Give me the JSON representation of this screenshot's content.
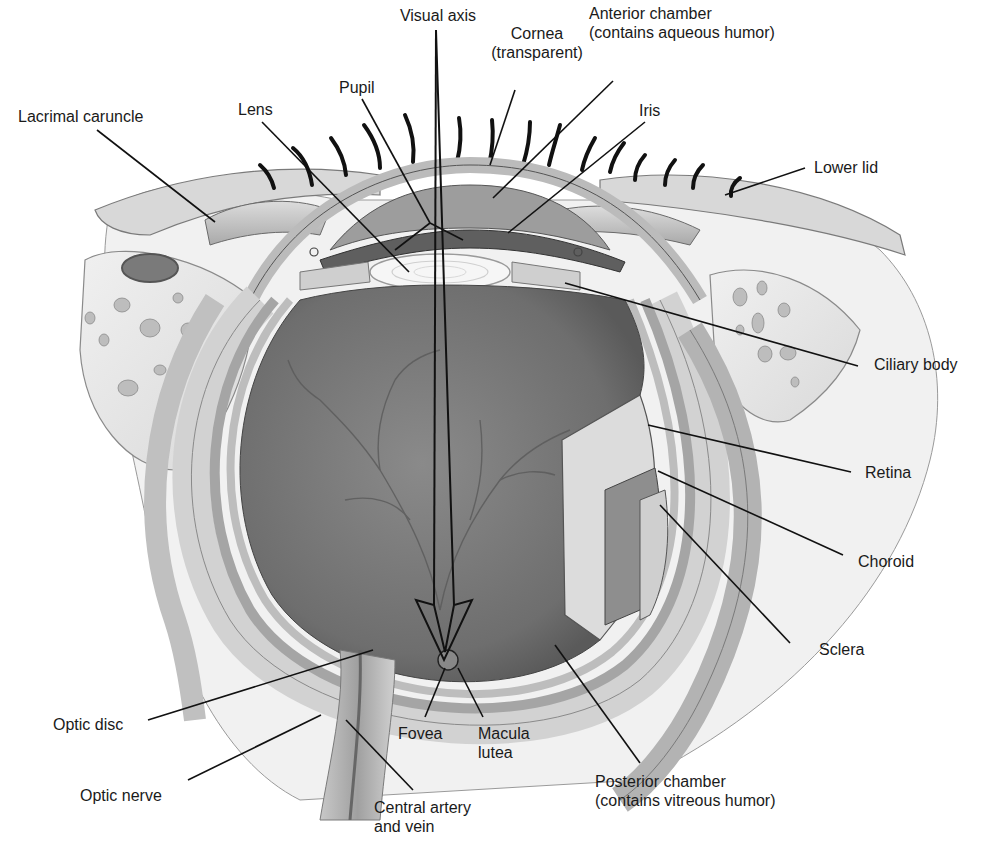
{
  "diagram": {
    "colors": {
      "background": "#ffffff",
      "line": "#111111",
      "tissue_light": "#e6e6e6",
      "tissue_mid": "#b5b5b5",
      "tissue_dark": "#6f6f6f",
      "vitreous": "#7c7c7c",
      "lens": "#f4f4f4"
    },
    "labels": {
      "visual_axis": {
        "lines": [
          "Visual axis"
        ]
      },
      "cornea": {
        "lines": [
          "Cornea",
          "(transparent)"
        ]
      },
      "anterior_chamber": {
        "lines": [
          "Anterior chamber",
          "(contains aqueous humor)"
        ]
      },
      "pupil": {
        "lines": [
          "Pupil"
        ]
      },
      "lens": {
        "lines": [
          "Lens"
        ]
      },
      "lacrimal_caruncle": {
        "lines": [
          "Lacrimal caruncle"
        ]
      },
      "iris": {
        "lines": [
          "Iris"
        ]
      },
      "lower_lid": {
        "lines": [
          "Lower lid"
        ]
      },
      "ciliary_body": {
        "lines": [
          "Ciliary body"
        ]
      },
      "retina": {
        "lines": [
          "Retina"
        ]
      },
      "choroid": {
        "lines": [
          "Choroid"
        ]
      },
      "sclera": {
        "lines": [
          "Sclera"
        ]
      },
      "optic_disc": {
        "lines": [
          "Optic disc"
        ]
      },
      "optic_nerve": {
        "lines": [
          "Optic nerve"
        ]
      },
      "fovea": {
        "lines": [
          "Fovea"
        ]
      },
      "macula_lutea": {
        "lines": [
          "Macula",
          "lutea"
        ]
      },
      "central_artery_vein": {
        "lines": [
          "Central artery",
          "and vein"
        ]
      },
      "posterior_chamber": {
        "lines": [
          "Posterior chamber",
          "(contains vitreous humor)"
        ]
      }
    }
  }
}
